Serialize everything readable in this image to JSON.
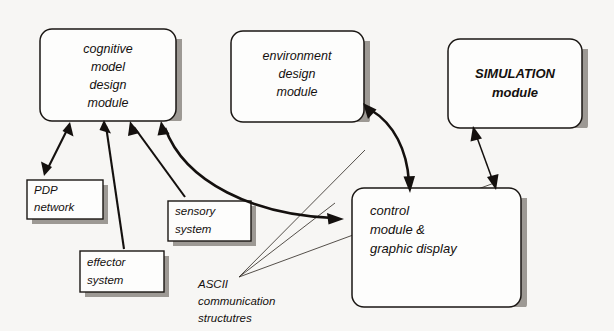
{
  "diagram": {
    "background_color": "#f7f6f4",
    "ink_color": "#14100e",
    "shadow_color": "#8d8882",
    "nodes": {
      "cognitive": {
        "id": "cognitive-model-design-module",
        "shape": "rounded-rect",
        "lines": [
          "cognitive",
          "model",
          "design",
          "module"
        ],
        "text_align": "center",
        "x": 40,
        "y": 29,
        "w": 136,
        "h": 92
      },
      "environment": {
        "id": "environment-design-module",
        "shape": "rounded-rect",
        "lines": [
          "environment",
          "design",
          "module"
        ],
        "text_align": "center",
        "x": 231,
        "y": 31,
        "w": 133,
        "h": 91
      },
      "simulation": {
        "id": "simulation-module",
        "shape": "rounded-rect",
        "lines": [
          "SIMULATION",
          "module"
        ],
        "text_align": "center",
        "x": 448,
        "y": 39,
        "w": 134,
        "h": 89
      },
      "control": {
        "id": "control-module-graphic-display",
        "shape": "rounded-rect",
        "lines": [
          "control",
          "module &",
          "graphic display"
        ],
        "text_align": "left",
        "x": 352,
        "y": 188,
        "w": 169,
        "h": 119
      },
      "pdp": {
        "id": "pdp-network",
        "shape": "rect",
        "lines": [
          "PDP",
          "network"
        ],
        "text_align": "left",
        "x": 27,
        "y": 180,
        "w": 76,
        "h": 39
      },
      "sensory": {
        "id": "sensory-system",
        "shape": "rect",
        "lines": [
          "sensory",
          "system"
        ],
        "text_align": "left",
        "x": 168,
        "y": 201,
        "w": 83,
        "h": 40
      },
      "effector": {
        "id": "effector-system",
        "shape": "rect",
        "lines": [
          "effector",
          "system"
        ],
        "text_align": "left",
        "x": 80,
        "y": 251,
        "w": 84,
        "h": 41
      }
    },
    "annotations": [
      {
        "id": "ascii-communication-structures",
        "lines": [
          "ASCII",
          "communication",
          "structutres"
        ],
        "x": 196,
        "y": 283
      }
    ],
    "connections": [
      {
        "id": "cognitive-pdp",
        "from": "cognitive-model-design-module",
        "to": "pdp-network",
        "style": "double-headed",
        "weight": "medium"
      },
      {
        "id": "effector-cognitive",
        "from": "effector-system",
        "to": "cognitive-model-design-module",
        "style": "single-headed",
        "weight": "medium"
      },
      {
        "id": "sensory-cognitive",
        "from": "sensory-system",
        "to": "cognitive-model-design-module",
        "style": "single-headed",
        "weight": "medium"
      },
      {
        "id": "cognitive-control",
        "from": "cognitive-model-design-module",
        "to": "control-module-graphic-display",
        "style": "double-headed",
        "weight": "thick-curved"
      },
      {
        "id": "environment-control",
        "from": "environment-design-module",
        "to": "control-module-graphic-display",
        "style": "double-headed",
        "weight": "thick-curved"
      },
      {
        "id": "simulation-control",
        "from": "simulation-module",
        "to": "control-module-graphic-display",
        "style": "double-headed",
        "weight": "thin"
      }
    ]
  }
}
